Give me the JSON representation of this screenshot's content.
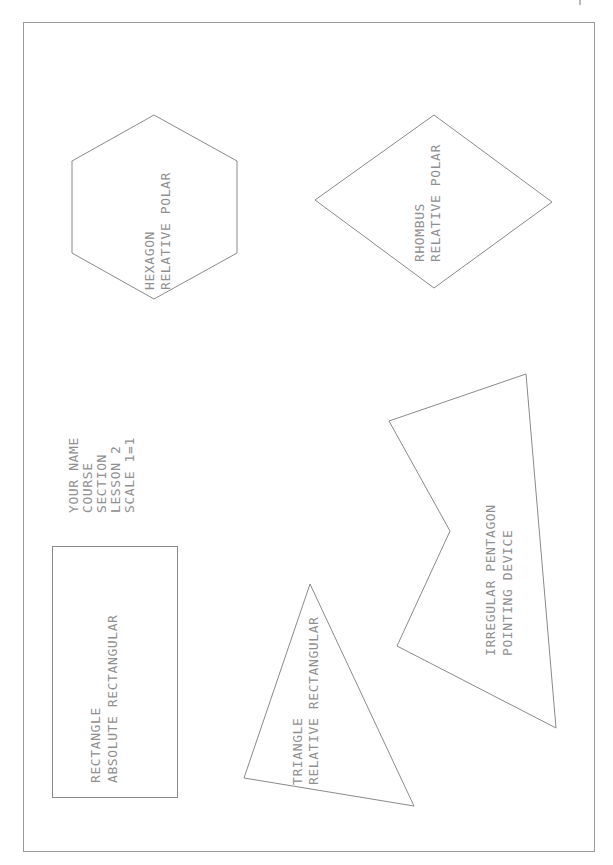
{
  "drawing": {
    "colors": {
      "background": "#ffffff",
      "line": "#8a8a8a",
      "text": "#8f8f8f"
    },
    "frame": {
      "x": 23,
      "y": 22,
      "width": 572,
      "height": 830
    },
    "title_block": {
      "lines": [
        "YOUR NAME",
        "COURSE",
        "SECTION",
        "LESSON 2",
        "SCALE 1=1"
      ]
    },
    "shapes": [
      {
        "type": "hexagon",
        "method": "relative polar",
        "label_lines": [
          "HEXAGON",
          "RELATIVE POLAR"
        ],
        "points": [
          [
            154,
            115
          ],
          [
            237,
            161
          ],
          [
            237,
            253
          ],
          [
            154,
            299
          ],
          [
            72,
            253
          ],
          [
            72,
            161
          ]
        ]
      },
      {
        "type": "rhombus",
        "method": "relative polar",
        "label_lines": [
          "RHOMBUS",
          "RELATIVE POLAR"
        ],
        "points": [
          [
            434,
            115
          ],
          [
            552,
            202
          ],
          [
            434,
            288
          ],
          [
            315,
            200
          ]
        ]
      },
      {
        "type": "irregular pentagon",
        "method": "pointing device",
        "label_lines": [
          "IRREGULAR PENTAGON",
          "POINTING DEVICE"
        ],
        "points": [
          [
            389,
            421
          ],
          [
            526,
            374
          ],
          [
            556,
            728
          ],
          [
            397,
            646
          ],
          [
            450,
            531
          ]
        ]
      },
      {
        "type": "triangle",
        "method": "relative rectangular",
        "label_lines": [
          "TRIANGLE",
          "RELATIVE RECTANGULAR"
        ],
        "points": [
          [
            310,
            584
          ],
          [
            414,
            806
          ],
          [
            244,
            778
          ]
        ]
      },
      {
        "type": "rectangle",
        "method": "absolute rectangular",
        "label_lines": [
          "RECTANGLE",
          "ABSOLUTE RECTANGULAR"
        ],
        "points": [
          [
            52,
            546
          ],
          [
            177,
            546
          ],
          [
            177,
            797
          ],
          [
            52,
            797
          ]
        ]
      }
    ]
  }
}
